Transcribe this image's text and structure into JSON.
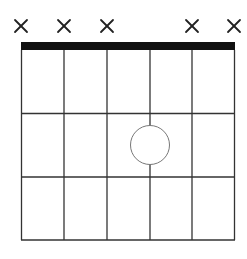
{
  "diagram": {
    "type": "guitar-chord-diagram",
    "num_strings": 6,
    "num_frets": 3,
    "strings": [
      {
        "index": 1,
        "marker": "muted"
      },
      {
        "index": 2,
        "marker": "muted"
      },
      {
        "index": 3,
        "marker": "muted"
      },
      {
        "index": 4,
        "marker": "none"
      },
      {
        "index": 5,
        "marker": "muted"
      },
      {
        "index": 6,
        "marker": "muted"
      }
    ],
    "notes": [
      {
        "string": 4,
        "fret": 2,
        "style": "open-circle"
      }
    ],
    "muted_symbol": "×",
    "colors": {
      "line": "#333333",
      "nut": "#111111",
      "note_stroke": "#777777",
      "note_fill": "#ffffff",
      "background": "#ffffff"
    }
  }
}
